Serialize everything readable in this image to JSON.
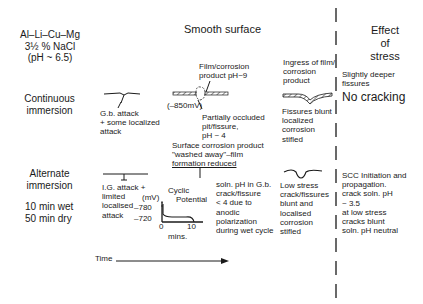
{
  "header": {
    "alloy": [
      "Al–Li–Cu–Mg",
      "3½ % NaCl",
      "(pH ~ 6.5)"
    ],
    "column_title": "Smooth surface",
    "effect_title": [
      "Effect",
      "of",
      "stress"
    ]
  },
  "rows": {
    "continuous": {
      "label": [
        "Continuous",
        "immersion"
      ],
      "stage1": [
        "G.b. attack",
        "+ some localized",
        "attack"
      ],
      "stage2_top": [
        "Film/corrosion",
        "product pH~9"
      ],
      "stage2_potential": "(–850mV)",
      "stage2_bottom": [
        "Partially occluded",
        "pit/fissure,",
        "pH ~ 4"
      ],
      "stage3_top": [
        "Ingress of film/",
        "corrosion",
        "product"
      ],
      "stage3_bottom": [
        "Fissures blunt",
        "localized",
        "corrosion",
        "stifled"
      ],
      "effect": [
        "Slightly deeper",
        "fissures"
      ],
      "effect_big": "No cracking"
    },
    "alternate": {
      "label": [
        "Alternate",
        "immersion"
      ],
      "schedule": [
        "10 min wet",
        "50 min dry"
      ],
      "transition_note": [
        "Surface corrosion product",
        "\"washed away\"–film",
        "formation reduced"
      ],
      "stage1": [
        "I.G. attack +",
        "limited",
        "localised",
        "attack"
      ],
      "inset": {
        "title": [
          "Cyclic",
          "Potential"
        ],
        "y_unit": "(mV)",
        "y_ticks": [
          "–780",
          "–720"
        ],
        "x_ticks": [
          "0",
          "10"
        ],
        "x_label": "mins."
      },
      "stage2": [
        "soln. pH in G.b.",
        "crack/fissure",
        "< 4 due to",
        "anodic",
        "polarization",
        "during wet cycle"
      ],
      "stage3": [
        "Low stress",
        "crack/fissures",
        "blunt and",
        "localised",
        "corrosion",
        "stifled"
      ],
      "effect": [
        "SCC Initiation and",
        "propagation.",
        "crack soln. pH",
        "~ 3.5",
        "at low stress",
        "cracks blunt",
        "soln. pH neutral"
      ]
    }
  },
  "time_axis": {
    "label": "Time"
  },
  "colors": {
    "ink": "#1a1a1a",
    "background": "#ffffff"
  }
}
